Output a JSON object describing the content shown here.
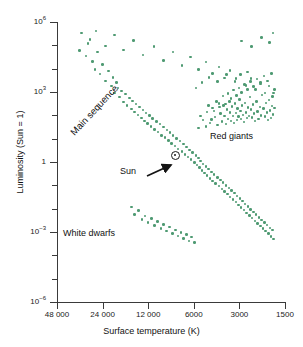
{
  "chart_data": {
    "type": "scatter",
    "title": "",
    "xlabel": "Surface temperature (K)",
    "ylabel": "Luminosity (Sun = 1)",
    "xscale": "log-reversed",
    "yscale": "log",
    "xlim": [
      48000,
      1500
    ],
    "ylim": [
      1e-06,
      1000000.0
    ],
    "grid": false,
    "legend": "none",
    "xticks": [
      {
        "value": 48000,
        "label": "48 000"
      },
      {
        "value": 24000,
        "label": "24 000"
      },
      {
        "value": 12000,
        "label": "12 000"
      },
      {
        "value": 6000,
        "label": "6000"
      },
      {
        "value": 3000,
        "label": "3000"
      },
      {
        "value": 1500,
        "label": "1500"
      }
    ],
    "yticks": [
      {
        "value": 1000000.0,
        "label": "10",
        "exp": "6"
      },
      {
        "value": 1000.0,
        "label": "10",
        "exp": "3"
      },
      {
        "value": 1,
        "label": "1",
        "exp": ""
      },
      {
        "value": 0.001,
        "label": "10",
        "exp": "−3"
      },
      {
        "value": 1e-06,
        "label": "10",
        "exp": "−6"
      }
    ],
    "point_color": "#4e9a72",
    "annotations": [
      {
        "name": "main-sequence",
        "text": "Main sequence",
        "rotation": -47
      },
      {
        "name": "red-giants",
        "text": "Red giants",
        "rotation": 0
      },
      {
        "name": "white-dwarfs",
        "text": "White dwarfs",
        "rotation": 0
      },
      {
        "name": "sun",
        "text": "Sun",
        "rotation": 0
      }
    ],
    "sun_marker": {
      "symbol": "☉",
      "temperature_K": 5800,
      "luminosity": 1
    },
    "groups": [
      {
        "name": "main-sequence",
        "count": 118,
        "points": [
          [
            34000,
            60000
          ],
          [
            31000,
            35000
          ],
          [
            30000,
            120000
          ],
          [
            28000,
            20000
          ],
          [
            27000,
            9000
          ],
          [
            26000,
            52000
          ],
          [
            25000,
            6000
          ],
          [
            24000,
            15000
          ],
          [
            23000,
            3000
          ],
          [
            22000,
            8000
          ],
          [
            21000,
            1800
          ],
          [
            20500,
            4200
          ],
          [
            20000,
            900
          ],
          [
            19500,
            2600
          ],
          [
            19000,
            1500
          ],
          [
            18500,
            620
          ],
          [
            18000,
            1100
          ],
          [
            17500,
            380
          ],
          [
            17000,
            820
          ],
          [
            16500,
            260
          ],
          [
            16000,
            560
          ],
          [
            15500,
            190
          ],
          [
            15200,
            420
          ],
          [
            14800,
            140
          ],
          [
            14400,
            300
          ],
          [
            14000,
            105
          ],
          [
            13700,
            230
          ],
          [
            13300,
            78
          ],
          [
            13000,
            170
          ],
          [
            12700,
            58
          ],
          [
            12400,
            128
          ],
          [
            12100,
            44
          ],
          [
            11800,
            96
          ],
          [
            11500,
            33
          ],
          [
            11200,
            72
          ],
          [
            10900,
            25
          ],
          [
            10600,
            55
          ],
          [
            10300,
            19
          ],
          [
            10000,
            42
          ],
          [
            9800,
            14
          ],
          [
            9500,
            32
          ],
          [
            9300,
            11
          ],
          [
            9000,
            24
          ],
          [
            8800,
            8.2
          ],
          [
            8600,
            18
          ],
          [
            8400,
            6.2
          ],
          [
            8200,
            13.5
          ],
          [
            8000,
            4.8
          ],
          [
            7800,
            10.2
          ],
          [
            7600,
            3.6
          ],
          [
            7400,
            7.8
          ],
          [
            7200,
            2.8
          ],
          [
            7000,
            5.9
          ],
          [
            6850,
            2.1
          ],
          [
            6700,
            4.4
          ],
          [
            6550,
            1.65
          ],
          [
            6400,
            3.3
          ],
          [
            6250,
            1.25
          ],
          [
            6100,
            2.5
          ],
          [
            5950,
            0.96
          ],
          [
            5800,
            1.9
          ],
          [
            5700,
            0.74
          ],
          [
            5600,
            1.45
          ],
          [
            5500,
            0.57
          ],
          [
            5400,
            1.1
          ],
          [
            5300,
            0.44
          ],
          [
            5200,
            0.84
          ],
          [
            5100,
            0.34
          ],
          [
            5000,
            0.64
          ],
          [
            4900,
            0.26
          ],
          [
            4800,
            0.5
          ],
          [
            4700,
            0.2
          ],
          [
            4600,
            0.38
          ],
          [
            4500,
            0.155
          ],
          [
            4400,
            0.29
          ],
          [
            4300,
            0.12
          ],
          [
            4200,
            0.22
          ],
          [
            4100,
            0.092
          ],
          [
            4000,
            0.17
          ],
          [
            3920,
            0.071
          ],
          [
            3840,
            0.13
          ],
          [
            3760,
            0.055
          ],
          [
            3680,
            0.1
          ],
          [
            3600,
            0.042
          ],
          [
            3520,
            0.078
          ],
          [
            3450,
            0.032
          ],
          [
            3380,
            0.06
          ],
          [
            3310,
            0.025
          ],
          [
            3240,
            0.046
          ],
          [
            3170,
            0.019
          ],
          [
            3100,
            0.035
          ],
          [
            3040,
            0.0145
          ],
          [
            2980,
            0.027
          ],
          [
            2920,
            0.0112
          ],
          [
            2860,
            0.021
          ],
          [
            2800,
            0.0086
          ],
          [
            2745,
            0.016
          ],
          [
            2690,
            0.0066
          ],
          [
            2635,
            0.0122
          ],
          [
            2580,
            0.0051
          ],
          [
            2525,
            0.0094
          ],
          [
            2475,
            0.0039
          ],
          [
            2425,
            0.0072
          ],
          [
            2375,
            0.003
          ],
          [
            2325,
            0.0055
          ],
          [
            2275,
            0.0023
          ],
          [
            2230,
            0.0042
          ],
          [
            2185,
            0.0018
          ],
          [
            2140,
            0.0033
          ],
          [
            2095,
            0.0014
          ],
          [
            2050,
            0.0026
          ],
          [
            2010,
            0.0011
          ],
          [
            1970,
            0.002
          ],
          [
            1930,
            0.00085
          ],
          [
            1890,
            0.0015
          ],
          [
            1855,
            0.00065
          ],
          [
            1820,
            0.0012
          ],
          [
            1790,
            0.0005
          ]
        ]
      },
      {
        "name": "red-giants",
        "count": 92,
        "points": [
          [
            5200,
            62
          ],
          [
            4900,
            140
          ],
          [
            4700,
            48
          ],
          [
            4500,
            210
          ],
          [
            4350,
            85
          ],
          [
            4200,
            38
          ],
          [
            4100,
            320
          ],
          [
            4000,
            120
          ],
          [
            3900,
            55
          ],
          [
            3820,
            260
          ],
          [
            3750,
            95
          ],
          [
            3680,
            42
          ],
          [
            3620,
            175
          ],
          [
            3560,
            70
          ],
          [
            3500,
            400
          ],
          [
            3450,
            135
          ],
          [
            3400,
            58
          ],
          [
            3350,
            240
          ],
          [
            3300,
            92
          ],
          [
            3250,
            46
          ],
          [
            3200,
            320
          ],
          [
            3160,
            125
          ],
          [
            3120,
            62
          ],
          [
            3080,
            200
          ],
          [
            3040,
            88
          ],
          [
            3000,
            480
          ],
          [
            2960,
            150
          ],
          [
            2920,
            68
          ],
          [
            2880,
            260
          ],
          [
            2840,
            105
          ],
          [
            2800,
            52
          ],
          [
            2760,
            340
          ],
          [
            2720,
            130
          ],
          [
            2680,
            75
          ],
          [
            2640,
            215
          ],
          [
            2600,
            95
          ],
          [
            2560,
            620
          ],
          [
            2520,
            175
          ],
          [
            2480,
            82
          ],
          [
            2440,
            290
          ],
          [
            2400,
            118
          ],
          [
            2360,
            58
          ],
          [
            2320,
            400
          ],
          [
            2280,
            145
          ],
          [
            2240,
            70
          ],
          [
            2200,
            230
          ],
          [
            2160,
            100
          ],
          [
            2120,
            760
          ],
          [
            2080,
            195
          ],
          [
            2040,
            88
          ],
          [
            2000,
            330
          ],
          [
            1970,
            135
          ],
          [
            1940,
            62
          ],
          [
            1910,
            450
          ],
          [
            1880,
            160
          ],
          [
            1860,
            78
          ],
          [
            1830,
            250
          ],
          [
            1800,
            110
          ],
          [
            1780,
            900
          ],
          [
            1760,
            210
          ],
          [
            5600,
            28
          ],
          [
            5400,
            95
          ],
          [
            5000,
            33
          ],
          [
            4800,
            260
          ],
          [
            4600,
            66
          ],
          [
            4400,
            150
          ],
          [
            4250,
            400
          ],
          [
            4050,
            230
          ],
          [
            3850,
            680
          ],
          [
            3700,
            310
          ],
          [
            3580,
            880
          ],
          [
            3420,
            520
          ],
          [
            3280,
            1200
          ],
          [
            3140,
            700
          ],
          [
            3020,
            1500
          ],
          [
            2900,
            950
          ],
          [
            2780,
            2100
          ],
          [
            2660,
            1300
          ],
          [
            2540,
            2800
          ],
          [
            2420,
            1700
          ],
          [
            2300,
            3600
          ],
          [
            2180,
            2200
          ],
          [
            2060,
            4800
          ],
          [
            1950,
            2900
          ],
          [
            1840,
            6200
          ],
          [
            5800,
            1500
          ],
          [
            5300,
            2600
          ],
          [
            4750,
            4200
          ],
          [
            4200,
            2800
          ],
          [
            3650,
            5500
          ],
          [
            3150,
            3800
          ],
          [
            2650,
            7200
          ]
        ]
      },
      {
        "name": "supergiants",
        "count": 34,
        "points": [
          [
            33000,
            330000
          ],
          [
            29000,
            180000
          ],
          [
            26500,
            420000
          ],
          [
            23000,
            95000
          ],
          [
            20000,
            280000
          ],
          [
            17500,
            62000
          ],
          [
            15000,
            160000
          ],
          [
            13000,
            38000
          ],
          [
            11000,
            88000
          ],
          [
            9500,
            22000
          ],
          [
            8200,
            52000
          ],
          [
            7200,
            14000
          ],
          [
            6300,
            31000
          ],
          [
            5600,
            9000
          ],
          [
            5000,
            19000
          ],
          [
            4500,
            6200
          ],
          [
            4100,
            12000
          ],
          [
            3750,
            4000
          ],
          [
            3450,
            8200
          ],
          [
            3200,
            2800
          ],
          [
            2950,
            5500
          ],
          [
            2720,
            1900
          ],
          [
            2520,
            3800
          ],
          [
            2340,
            1300
          ],
          [
            2180,
            2600
          ],
          [
            2040,
            900
          ],
          [
            1920,
            1800
          ],
          [
            1820,
            640
          ],
          [
            1760,
            1300
          ],
          [
            2900,
            150000
          ],
          [
            2500,
            90000
          ],
          [
            2150,
            220000
          ],
          [
            1900,
            130000
          ],
          [
            1800,
            330000
          ]
        ]
      },
      {
        "name": "white-dwarfs",
        "count": 22,
        "points": [
          [
            15500,
            0.012
          ],
          [
            14800,
            0.0055
          ],
          [
            13900,
            0.0082
          ],
          [
            13200,
            0.0035
          ],
          [
            12600,
            0.0048
          ],
          [
            12000,
            0.0026
          ],
          [
            11400,
            0.0038
          ],
          [
            10900,
            0.0019
          ],
          [
            10400,
            0.0028
          ],
          [
            9900,
            0.0014
          ],
          [
            9500,
            0.0021
          ],
          [
            9100,
            0.0011
          ],
          [
            8700,
            0.0016
          ],
          [
            8300,
            0.00085
          ],
          [
            7950,
            0.0012
          ],
          [
            7600,
            0.00066
          ],
          [
            7300,
            0.00095
          ],
          [
            7000,
            0.00052
          ],
          [
            6700,
            0.00078
          ],
          [
            6450,
            0.00042
          ],
          [
            6200,
            0.0006
          ],
          [
            5950,
            0.00035
          ]
        ]
      }
    ]
  }
}
